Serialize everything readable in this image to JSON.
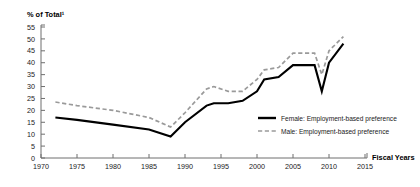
{
  "chart_data": {
    "type": "line",
    "title": "",
    "ylabel": "% of Total¹",
    "xlabel": "Fiscal Years",
    "xlim": [
      1970,
      2015
    ],
    "ylim": [
      0,
      55
    ],
    "ytick_step": 5,
    "xtick_step": 5,
    "grid": false,
    "legend_position": "center-right",
    "yticks": [
      "55",
      "50",
      "45",
      "40",
      "35",
      "30",
      "25",
      "20",
      "15",
      "10",
      "5",
      "0"
    ],
    "xticks": [
      "1970",
      "1975",
      "1980",
      "1985",
      "1990",
      "1995",
      "2000",
      "2005",
      "2010",
      "2015"
    ],
    "series": [
      {
        "name": "Female: Employment-based preference",
        "style": "solid",
        "color": "#000000",
        "x": [
          1972,
          1975,
          1980,
          1985,
          1988,
          1990,
          1993,
          1994,
          1996,
          1998,
          2000,
          2001,
          2003,
          2005,
          2007,
          2008,
          2009,
          2010,
          2012
        ],
        "values": [
          17,
          16,
          14,
          12,
          9,
          15,
          22,
          23,
          23,
          24,
          28,
          33,
          34,
          39,
          39,
          39,
          28,
          40,
          48
        ]
      },
      {
        "name": "Male: Employment-based preference",
        "style": "dashed",
        "color": "#9a9a9a",
        "x": [
          1972,
          1975,
          1980,
          1985,
          1988,
          1990,
          1993,
          1994,
          1996,
          1998,
          2000,
          2001,
          2003,
          2005,
          2007,
          2008,
          2009,
          2010,
          2012
        ],
        "values": [
          23.5,
          22,
          20,
          17,
          13,
          19,
          29,
          30,
          28,
          28,
          33,
          37,
          38,
          44,
          44,
          44,
          35,
          45,
          51
        ]
      }
    ]
  },
  "legend": {
    "items": [
      {
        "label": "Female: Employment-based preference",
        "style": "solid"
      },
      {
        "label": "Male: Employment-based preference",
        "style": "dashed"
      }
    ]
  }
}
